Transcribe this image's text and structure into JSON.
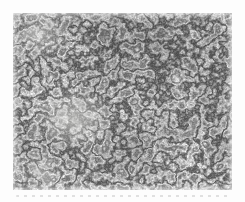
{
  "image": {
    "kind": "optical-micrograph",
    "description": "Black-and-white optical micrograph of a metal microstructure: light equiaxed grains outlined by dark reticulated grain boundaries, with fine gray speckle, printed as a photograph inset on a white page margin",
    "alt": "Grainy black-and-white micrograph of metal grain structure"
  },
  "colors": {
    "page_background": "#fdfdfd",
    "photo_base": "#cfcfcc",
    "grain_light": "#d9d9d6",
    "speckle_mid": "#9a9a97",
    "boundary_dark": "#4a4a4a"
  }
}
